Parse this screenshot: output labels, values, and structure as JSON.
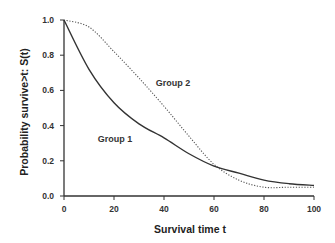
{
  "chart_data": {
    "type": "line",
    "title": "",
    "xlabel": "Survival time t",
    "ylabel": "Probability survive>t: S(t)",
    "xlim": [
      0,
      100
    ],
    "ylim": [
      0.0,
      1.0
    ],
    "x_ticks": [
      0,
      20,
      40,
      60,
      80,
      100
    ],
    "x_tick_labels": [
      "0",
      "20",
      "40",
      "60",
      "80",
      "100"
    ],
    "y_ticks": [
      0.0,
      0.2,
      0.4,
      0.6,
      0.8,
      1.0
    ],
    "y_tick_labels": [
      "0.0",
      "0.2",
      "0.4",
      "0.6",
      "0.8",
      "1.0"
    ],
    "grid": false,
    "legend": null,
    "x": [
      0,
      10,
      20,
      30,
      40,
      50,
      60,
      70,
      80,
      90,
      100
    ],
    "series": [
      {
        "name": "Group 1",
        "style": "solid",
        "color": "#333333",
        "values": [
          1.0,
          0.72,
          0.53,
          0.41,
          0.33,
          0.24,
          0.17,
          0.13,
          0.09,
          0.07,
          0.06
        ]
      },
      {
        "name": "Group 2",
        "style": "dotted",
        "color": "#555555",
        "values": [
          1.0,
          0.96,
          0.82,
          0.67,
          0.51,
          0.34,
          0.18,
          0.09,
          0.05,
          0.05,
          0.05
        ]
      }
    ],
    "annotations": [
      {
        "text": "Group 1",
        "x": 24,
        "y": 0.33
      },
      {
        "text": "Group 2",
        "x": 44,
        "y": 0.64
      }
    ]
  },
  "labels": {
    "xlabel": "Survival time t",
    "ylabel": "Probability survive>t: S(t)",
    "group1": "Group 1",
    "group2": "Group 2",
    "xticks": [
      "0",
      "20",
      "40",
      "60",
      "80",
      "100"
    ],
    "yticks": [
      "0.0",
      "0.2",
      "0.4",
      "0.6",
      "0.8",
      "1.0"
    ]
  }
}
